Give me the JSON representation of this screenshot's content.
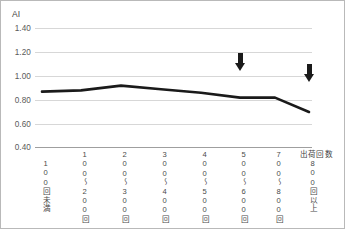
{
  "chart_data": {
    "type": "line",
    "title": "",
    "ylabel": "AI",
    "xlabel": "出荷回数",
    "ylim": [
      0.4,
      1.4
    ],
    "yticks": [
      "1.40",
      "1.20",
      "1.00",
      "0.80",
      "0.60",
      "0.40"
    ],
    "ytick_values": [
      1.4,
      1.2,
      1.0,
      0.8,
      0.6,
      0.4
    ],
    "grid": true,
    "legend": false,
    "categories": [
      "100回未満",
      "100～200回",
      "200～300回",
      "300～400回",
      "400～500回",
      "500～600回",
      "700～800回",
      "800回以上"
    ],
    "values": [
      0.87,
      0.88,
      0.92,
      0.89,
      0.86,
      0.82,
      0.82,
      0.7
    ],
    "series": [
      {
        "name": "AI",
        "color": "#1a1a1a",
        "values": [
          0.87,
          0.88,
          0.92,
          0.89,
          0.86,
          0.82,
          0.82,
          0.7
        ]
      }
    ],
    "annotations": [
      {
        "kind": "down-arrow",
        "at_category": "500～600回",
        "x_index": 5,
        "y_top": 0.99,
        "y_tip": 0.845
      },
      {
        "kind": "down-arrow",
        "at_category": "800回以上",
        "x_index": 7,
        "y_top": 0.9,
        "y_tip": 0.745
      }
    ]
  },
  "colors": {
    "line": "#1a1a1a",
    "gridline": "#d7d7d7",
    "axis": "#9f9f9f",
    "tick_text": "#5a5a5a",
    "frame": "#b9b9b9",
    "background": "#ffffff"
  }
}
